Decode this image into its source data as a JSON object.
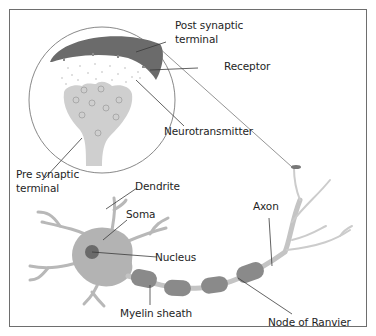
{
  "diagram": {
    "colors": {
      "frame": "#6e6e6e",
      "post_synaptic": "#6b6b6b",
      "pre_synaptic": "#cfcfcf",
      "soma": "#b3b3b3",
      "nucleus": "#6a6a6a",
      "myelin": "#8a8a8a",
      "axon": "#c4c4c4",
      "leader_line": "#3a3a3a"
    },
    "labels": {
      "post_synaptic_line1": "Post synaptic",
      "post_synaptic_line2": "terminal",
      "receptor": "Receptor",
      "neurotransmitter": "Neurotransmitter",
      "pre_synaptic_line1": "Pre synaptic",
      "pre_synaptic_line2": "terminal",
      "dendrite": "Dendrite",
      "soma": "Soma",
      "nucleus": "Nucleus",
      "axon": "Axon",
      "myelin_sheath": "Myelin sheath",
      "node_of_ranvier": "Node of Ranvier"
    }
  }
}
